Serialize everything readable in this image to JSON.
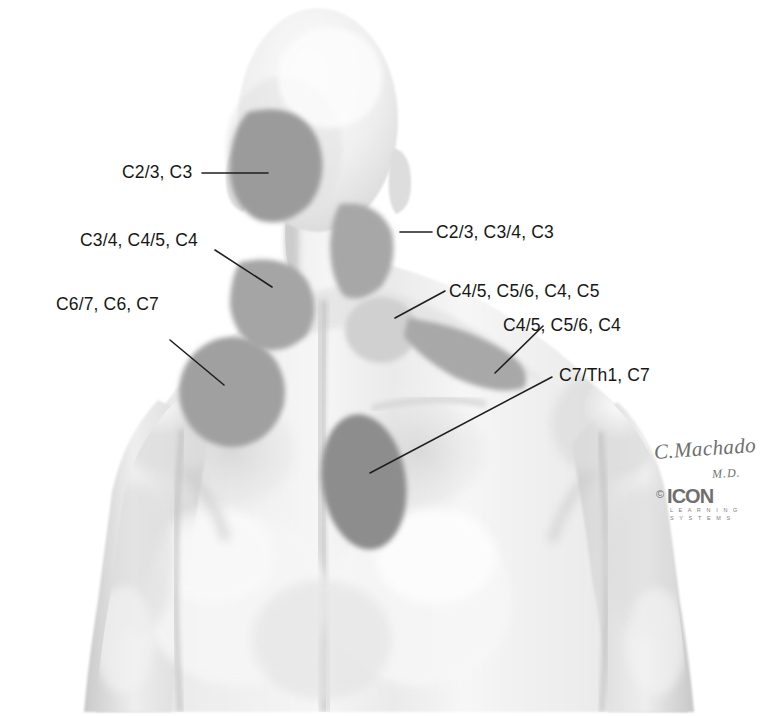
{
  "figure": {
    "view": "posterior-upper-back-and-head",
    "background_color": "#ffffff",
    "skin_base_color": "#efefef",
    "shade_dark_color": "#8f8f8f",
    "shade_mid_color": "#a9a9a9",
    "shade_light_color": "#d2d2d2",
    "leader_line_color": "#1f1f1f"
  },
  "labels": [
    {
      "id": "occipital",
      "text": "C2/3, C3",
      "x": 122,
      "y": 164,
      "region": "occiput-suboccipital",
      "leader": {
        "x1": 202,
        "y1": 173,
        "x2": 268,
        "y2": 173
      }
    },
    {
      "id": "lateral-neck",
      "text": "C2/3, C3/4, C3",
      "x": 436,
      "y": 224,
      "region": "upper-lateral-neck",
      "leader": {
        "x1": 400,
        "y1": 232,
        "x2": 432,
        "y2": 232
      }
    },
    {
      "id": "nuchal",
      "text": "C3/4, C4/5, C4",
      "x": 80,
      "y": 232,
      "region": "lower-posterior-neck",
      "leader": {
        "x1": 215,
        "y1": 250,
        "x2": 272,
        "y2": 287
      }
    },
    {
      "id": "supraspinous",
      "text": "C4/5, C5/6, C4, C5",
      "x": 449,
      "y": 283,
      "region": "supraspinatus-suprascapular",
      "leader": {
        "x1": 395,
        "y1": 318,
        "x2": 445,
        "y2": 291
      }
    },
    {
      "id": "medial-scapula",
      "text": "C6/7, C6, C7",
      "x": 56,
      "y": 296,
      "region": "medial-scapular-border",
      "leader": {
        "x1": 170,
        "y1": 340,
        "x2": 224,
        "y2": 385
      }
    },
    {
      "id": "shoulder-deltoid",
      "text": "C4/5, C5/6, C4",
      "x": 503,
      "y": 317,
      "region": "lateral-shoulder-deltoid",
      "leader": {
        "x1": 495,
        "y1": 373,
        "x2": 543,
        "y2": 326
      }
    },
    {
      "id": "interscapular",
      "text": "C7/Th1, C7",
      "x": 559,
      "y": 367,
      "region": "interscapular-paraspinal",
      "leader": {
        "x1": 370,
        "y1": 473,
        "x2": 552,
        "y2": 377
      }
    }
  ],
  "pain_regions": [
    {
      "id": "occipital-patch",
      "shade": "dark",
      "label_ref": "occipital"
    },
    {
      "id": "lateral-neck-patch",
      "shade": "mid",
      "label_ref": "lateral-neck"
    },
    {
      "id": "nuchal-patch",
      "shade": "mid",
      "label_ref": "nuchal"
    },
    {
      "id": "supraspinous-patch",
      "shade": "light",
      "label_ref": "supraspinous"
    },
    {
      "id": "scapular-patch",
      "shade": "mid",
      "label_ref": "medial-scapula"
    },
    {
      "id": "deltoid-patch",
      "shade": "mid",
      "label_ref": "shoulder-deltoid"
    },
    {
      "id": "interscapular-patch",
      "shade": "dark",
      "label_ref": "interscapular"
    }
  ],
  "signature": {
    "artist": "C.Machado",
    "credential": "M.D.",
    "copyright": "©",
    "brand": "ICON",
    "brand_sub_line1": "L E A R N I N G",
    "brand_sub_line2": "S Y S T E M S"
  }
}
